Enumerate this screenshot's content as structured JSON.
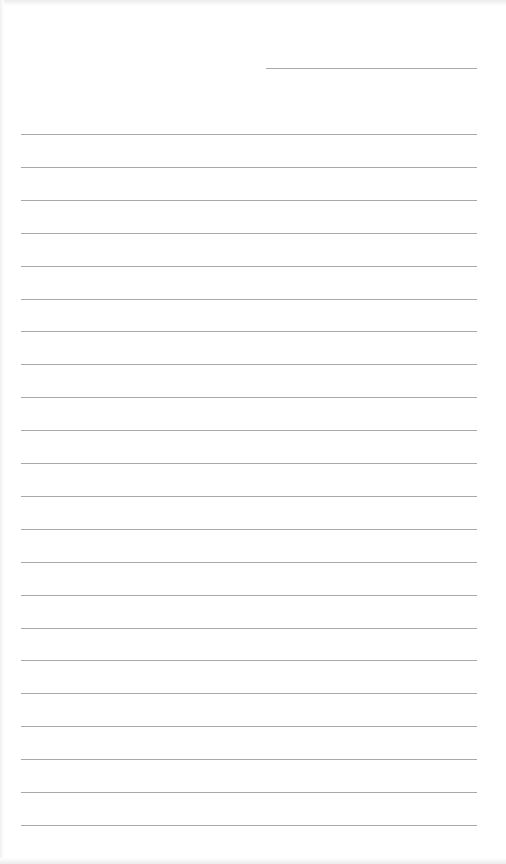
{
  "page": {
    "type": "lined-paper",
    "background_color": "#ffffff",
    "line_color": "#a9a9a9",
    "header_line": {
      "x": 266,
      "y": 68,
      "width": 211
    },
    "rules": {
      "count": 22,
      "first_y": 134,
      "spacing": 32.9,
      "x": 21,
      "width": 456
    }
  }
}
